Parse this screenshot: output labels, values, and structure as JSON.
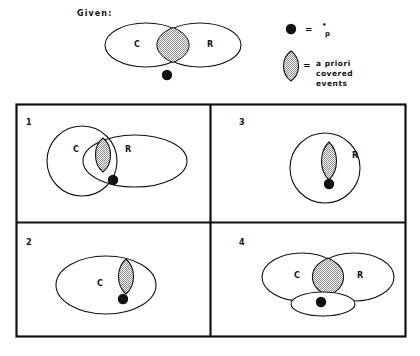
{
  "figure": {
    "given_label": "Given:",
    "background_color": "#ffffff",
    "ink_color": "#111111",
    "shade_color": "#9a9a9a",
    "set_labels": {
      "c": "C",
      "r": "R"
    },
    "given_diagram": {
      "name": "given-venn",
      "sets": [
        "C",
        "R"
      ],
      "shaded_region": "C-and-R-intersection",
      "point_position": "below-intersection-outside"
    },
    "legend": {
      "items": [
        {
          "key": "point-marker",
          "symbol": "filled-circle",
          "equals": "=",
          "text": "p",
          "superscript_dot": "•",
          "description_lines": [
            "p"
          ]
        },
        {
          "key": "shaded-lens",
          "symbol": "shaded-lens",
          "equals": "=",
          "text": "a priori covered events",
          "description_lines": [
            "a priori",
            "covered",
            "events"
          ]
        }
      ]
    },
    "grid": {
      "columns": 2,
      "rows": 2,
      "panels": [
        {
          "number": "1",
          "position": "top-left",
          "sets": [
            "C",
            "R"
          ],
          "c_shape": "circle",
          "r_shape": "ellipse",
          "overlap": true,
          "shaded_region": "inside-C-and-R-intersection",
          "point_inside": "C-and-R-intersection",
          "labels": {
            "c": "C",
            "r": "R"
          }
        },
        {
          "number": "3",
          "position": "top-right",
          "sets": [
            "R"
          ],
          "r_shape": "circle",
          "overlap": false,
          "shaded_region": "inside-R",
          "point_inside": "R",
          "labels": {
            "r": "R"
          }
        },
        {
          "number": "2",
          "position": "bottom-left",
          "sets": [
            "C"
          ],
          "c_shape": "ellipse",
          "overlap": false,
          "shaded_region": "inside-C",
          "point_inside": "C",
          "labels": {
            "c": "C"
          }
        },
        {
          "number": "4",
          "position": "bottom-right",
          "sets": [
            "C",
            "R",
            "third-ellipse"
          ],
          "c_shape": "ellipse",
          "r_shape": "ellipse",
          "overlap": true,
          "shaded_region": "C-and-R-intersection",
          "point_inside": "third-ellipse-below",
          "labels": {
            "c": "C",
            "r": "R"
          }
        }
      ]
    }
  }
}
